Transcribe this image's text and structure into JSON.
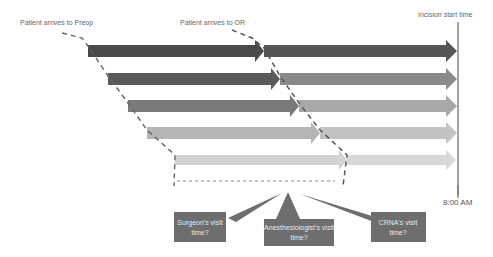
{
  "labels": {
    "preop": "Patient arrives to Preop",
    "or": "Patient arrives to OR",
    "incision": "Incision start time",
    "time": "8:00 AM"
  },
  "colors": {
    "row1_left": "#4a4a4a",
    "row1_right": "#555555",
    "row2_left": "#5a5a5a",
    "row2_right": "#8a8a8a",
    "row3_left": "#7a7a7a",
    "row3_right": "#a8a8a8",
    "row4_left": "#b5b5b5",
    "row4_right": "#c2c2c2",
    "row5_left": "#d2d2d2",
    "row5_right": "#d8d8d8",
    "callout": "#6e6e6e"
  },
  "callouts": [
    {
      "line1": "Surgeon's visit",
      "line2": "time?"
    },
    {
      "line1": "Anesthesiologist's visit",
      "line2": "time?"
    },
    {
      "line1": "CRNA's visit",
      "line2": "time?"
    }
  ]
}
